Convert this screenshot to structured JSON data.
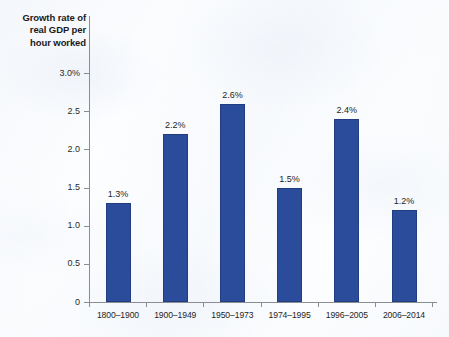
{
  "chart_data": {
    "type": "bar",
    "title": "Growth rate of real GDP per hour worked",
    "title_lines": [
      "Growth rate of",
      "real GDP per",
      "hour worked"
    ],
    "xlabel": "",
    "ylabel": "",
    "ylim": [
      0,
      3.0
    ],
    "grid": false,
    "legend": null,
    "bar_color": "#2B4B9B",
    "axis_color": "#8A8D92",
    "categories": [
      "1800–1900",
      "1900–1949",
      "1950–1973",
      "1974–1995",
      "1996–2005",
      "2006–2014"
    ],
    "values": [
      1.3,
      2.2,
      2.6,
      1.5,
      2.4,
      1.2
    ],
    "data_labels": [
      "1.3%",
      "2.2%",
      "2.6%",
      "1.5%",
      "2.4%",
      "1.2%"
    ],
    "ytick_values": [
      0,
      0.5,
      1.0,
      1.5,
      2.0,
      2.5,
      3.0
    ],
    "ytick_labels": [
      "0",
      "0.5",
      "1.0",
      "1.5",
      "2.0",
      "2.5",
      "3.0%"
    ]
  }
}
